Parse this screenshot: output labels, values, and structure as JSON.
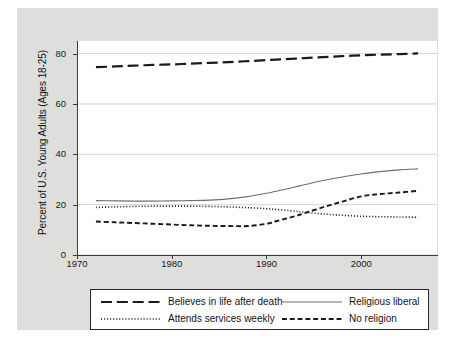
{
  "chart_data": {
    "type": "line",
    "title": "",
    "xlabel": "",
    "ylabel": "Percent of U.S. Young Adults (Ages 18-25)",
    "xlim": [
      1970,
      2008
    ],
    "ylim": [
      0,
      85
    ],
    "grid": "horizontal",
    "legend_position": "below-plot",
    "xticks": [
      "1970",
      "1980",
      "1990",
      "2000"
    ],
    "xtick_values": [
      1970,
      1980,
      1990,
      2000
    ],
    "yticks": [
      "0",
      "20",
      "40",
      "60",
      "80"
    ],
    "ytick_values": [
      0,
      20,
      40,
      60,
      80
    ],
    "x": [
      1972,
      1974,
      1976,
      1978,
      1980,
      1982,
      1984,
      1986,
      1988,
      1990,
      1991,
      1993,
      1994,
      1996,
      1998,
      2000,
      2002,
      2004,
      2006
    ],
    "series": [
      {
        "name": "Believes in life after death",
        "style": "long-dash",
        "color": "#1a1a1a",
        "width": 2.2,
        "values": [
          74.6,
          74.9,
          75.2,
          75.5,
          75.7,
          76.0,
          76.3,
          76.6,
          77.0,
          77.4,
          77.6,
          78.0,
          78.2,
          78.6,
          79.0,
          79.3,
          79.6,
          79.8,
          80.1
        ]
      },
      {
        "name": "Religious liberal",
        "style": "solid",
        "color": "#6e6e6e",
        "width": 1.1,
        "values": [
          21.6,
          21.5,
          21.4,
          21.4,
          21.5,
          21.6,
          21.8,
          22.3,
          23.2,
          24.5,
          25.3,
          27.0,
          27.9,
          29.6,
          31.0,
          32.2,
          33.1,
          33.8,
          34.2
        ]
      },
      {
        "name": "Attends services weekly",
        "style": "dotted",
        "color": "#1a1a1a",
        "width": 1.6,
        "values": [
          18.9,
          19.1,
          19.3,
          19.4,
          19.4,
          19.4,
          19.3,
          19.1,
          18.8,
          18.4,
          18.1,
          17.4,
          17.0,
          16.3,
          15.8,
          15.4,
          15.2,
          15.1,
          15.0
        ]
      },
      {
        "name": "No religion",
        "style": "dash",
        "color": "#1a1a1a",
        "width": 1.9,
        "values": [
          13.3,
          13.0,
          12.7,
          12.4,
          12.1,
          11.8,
          11.6,
          11.5,
          11.5,
          12.4,
          13.4,
          15.4,
          16.6,
          19.0,
          21.2,
          23.3,
          24.2,
          24.8,
          25.5
        ]
      }
    ],
    "legend": [
      {
        "label": "Believes in life after death",
        "style": "long-dash"
      },
      {
        "label": "Religious liberal",
        "style": "solid"
      },
      {
        "label": "Attends services weekly",
        "style": "dotted"
      },
      {
        "label": "No religion",
        "style": "dash"
      }
    ]
  }
}
